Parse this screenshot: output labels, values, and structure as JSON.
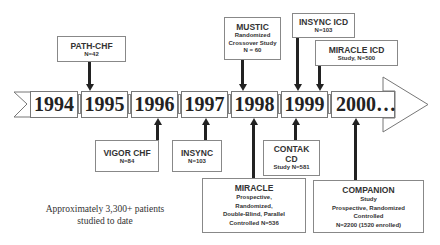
{
  "timeline": {
    "years": [
      "1994",
      "1995",
      "1996",
      "1997",
      "1998",
      "1999",
      "2000…"
    ]
  },
  "studies_above": [
    {
      "name": "PATH-CHF",
      "lines": [
        "N=42"
      ],
      "year": "1995"
    },
    {
      "name": "MUSTIC",
      "lines": [
        "Randomized",
        "Crossover Study",
        "N = 60"
      ],
      "year": "1998"
    },
    {
      "name": "INSYNC ICD",
      "lines": [
        "N=103"
      ],
      "year": "1999"
    },
    {
      "name": "MIRACLE ICD",
      "lines": [
        "Study, N=500"
      ],
      "year": "1999"
    }
  ],
  "studies_below": [
    {
      "name": "VIGOR CHF",
      "lines": [
        "N=84"
      ],
      "year": "1996"
    },
    {
      "name": "INSYNC",
      "lines": [
        "N=103"
      ],
      "year": "1997"
    },
    {
      "name": "CONTAK CD",
      "lines": [
        "Study N=581"
      ],
      "year": "1999"
    },
    {
      "name": "MIRACLE",
      "lines": [
        "Prospective,",
        "Randomized,",
        "Double-Blind, Parallel",
        "Controlled N=536"
      ],
      "year": "1998"
    },
    {
      "name": "COMPANION",
      "lines": [
        "Study",
        "Prospective, Randomized",
        "Controlled",
        "N=2200 (1520 enrolled)"
      ],
      "year": "2000…"
    }
  ],
  "summary": {
    "line1": "Approximately 3,300+ patients",
    "line2": "studied to date"
  }
}
